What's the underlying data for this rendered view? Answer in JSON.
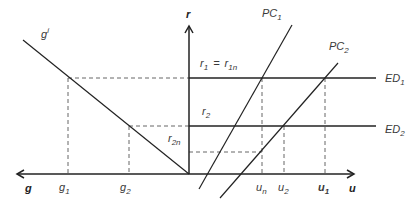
{
  "diagram": {
    "axes": {
      "vertical": "r",
      "horizontal_right": "u",
      "horizontal_left": "g"
    },
    "curves": {
      "investment_line": {
        "base": "g",
        "sup": "i"
      },
      "pc1": {
        "base": "PC",
        "sub": "1"
      },
      "pc2": {
        "base": "PC",
        "sub": "2"
      },
      "ed1": {
        "base": "ED",
        "sub": "1"
      },
      "ed2": {
        "base": "ED",
        "sub": "2"
      }
    },
    "r_labels": {
      "r1": {
        "base": "r",
        "sub": "1"
      },
      "eq": "=",
      "r1n": {
        "base": "r",
        "sub": "1n"
      },
      "r2": {
        "base": "r",
        "sub": "2"
      },
      "r2n": {
        "base": "r",
        "sub": "2n"
      }
    },
    "g_ticks": [
      {
        "base": "g",
        "sub": "1"
      },
      {
        "base": "g",
        "sub": "2"
      }
    ],
    "u_ticks": [
      {
        "base": "u",
        "sub": "n"
      },
      {
        "base": "u",
        "sub": "2"
      },
      {
        "base": "u",
        "sub": "1"
      }
    ]
  }
}
